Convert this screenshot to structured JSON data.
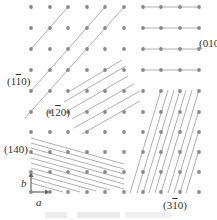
{
  "diagram": {
    "type": "crystal-lattice-planes",
    "lattice": {
      "columns_x": [
        31,
        50,
        68,
        87,
        105,
        124,
        143,
        161,
        180,
        199
      ],
      "rows_y": [
        7,
        28,
        49,
        70,
        91,
        112,
        132,
        152,
        172,
        192
      ],
      "dot_color": "#8a8a8a",
      "line_color": "#9a9a9a"
    },
    "labels": {
      "plane_1m10": {
        "pre": "(1",
        "bar": "1",
        "post": "0)"
      },
      "plane_010": {
        "text": "(010"
      },
      "plane_1m20": {
        "pre": "(1",
        "bar": "2",
        "post": "0)"
      },
      "plane_140": {
        "text": "(140)"
      },
      "plane_3m10": {
        "pre": "(3",
        "bar": "1",
        "post": "0)"
      },
      "axis_a": "a",
      "axis_b": "b"
    },
    "caption": ""
  }
}
